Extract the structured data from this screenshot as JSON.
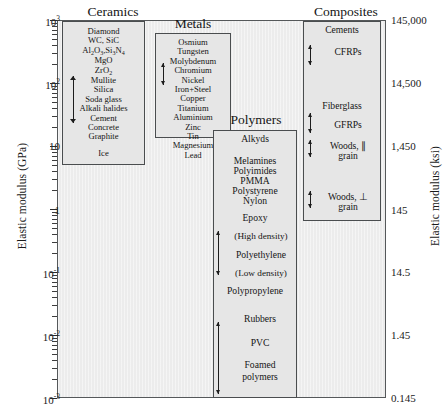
{
  "chart_data": {
    "type": "bar",
    "xlabel": "",
    "ylabel": "Elastic modulus (GPa)",
    "y2label": "Elastic modulus (ksi)",
    "yscale": "log",
    "ylim": [
      0.001,
      1000
    ],
    "y2lim": [
      0.145,
      145000
    ],
    "ytick_labels": [
      "10",
      "10",
      "10",
      "1",
      "10",
      "10",
      "10"
    ],
    "ytick_exponents": [
      "3",
      "2",
      "",
      "",
      "-1",
      "-2",
      "-3"
    ],
    "ytick_values": [
      1000,
      100,
      10,
      1,
      0.1,
      0.01,
      0.001
    ],
    "y2tick_labels": [
      "145,000",
      "14,500",
      "1,450",
      "145",
      "14.5",
      "1.45",
      "0.145"
    ],
    "y2tick_values": [
      145000,
      14500,
      1450,
      145,
      14.5,
      1.45,
      0.145
    ],
    "grid": false,
    "legend": "none",
    "categories": [
      "Ceramics",
      "Metals",
      "Polymers",
      "Composites"
    ],
    "series": [
      {
        "name": "Ceramics",
        "range_gpa": [
          30,
          1000
        ],
        "box_top_gpa": 1000,
        "box_bottom_gpa": 9
      },
      {
        "name": "Metals",
        "range_gpa": [
          40,
          220
        ],
        "box_top_gpa": 700,
        "box_bottom_gpa": 45
      },
      {
        "name": "Polymers",
        "range_gpa": [
          0.005,
          5
        ],
        "box_top_gpa": 5,
        "box_bottom_gpa": 0.0012
      },
      {
        "name": "Composites",
        "range_gpa": [
          0.6,
          300
        ],
        "box_top_gpa": 600,
        "box_bottom_gpa": 0.9
      }
    ]
  },
  "axes": {
    "left": {
      "title": "Elastic modulus (GPa)",
      "ticks": [
        {
          "base": "10",
          "exp": "3"
        },
        {
          "base": "10",
          "exp": "2"
        },
        {
          "base": "10",
          "exp": ""
        },
        {
          "base": "1",
          "exp": ""
        },
        {
          "base": "10",
          "exp": "-1"
        },
        {
          "base": "10",
          "exp": "-2"
        },
        {
          "base": "10",
          "exp": "-3"
        }
      ]
    },
    "right": {
      "title": "Elastic modulus (ksi)",
      "ticks": [
        "145,000",
        "14,500",
        "1,450",
        "145",
        "14.5",
        "1.45",
        "0.145"
      ]
    }
  },
  "classes": {
    "ceramics": {
      "header": "Ceramics",
      "items": [
        "Diamond",
        "WC, SiC",
        "Al2O3,Si3N4",
        "MgO",
        "ZrO2",
        "Mullite",
        "Silica",
        "Soda glass",
        "Alkali halides",
        "Cement",
        "Concrete",
        "Graphite",
        "Ice"
      ]
    },
    "metals": {
      "header": "Metals",
      "items": [
        "Osmium",
        "Tungsten",
        "Molybdenum",
        "Chromium",
        "Nickel",
        "Iron+Steel",
        "Copper",
        "Titanium",
        "Aluminium",
        "Zinc",
        "Tin",
        "Magnesium",
        "Lead"
      ]
    },
    "polymers": {
      "header": "Polymers",
      "items": [
        "Alkyds",
        "Melamines",
        "Polyimides",
        "PMMA",
        "Polystyrene",
        "Nylon",
        "Epoxy",
        "(High density)",
        "Polyethylene",
        "(Low density)",
        "Polypropylene",
        "Rubbers",
        "PVC",
        "Foamed",
        "polymers"
      ]
    },
    "composites": {
      "header": "Composites",
      "items": [
        "Cements",
        "CFRPs",
        "Fiberglass",
        "GFRPs",
        "Woods, ∥",
        "grain",
        "Woods, ⊥",
        "grain"
      ]
    }
  },
  "colors": {
    "plot_background": "#ececec",
    "box_fill": "#e6e6e6",
    "box_border": "#4a4d4f",
    "text": "#151515",
    "arrow": "#1d1d1d"
  }
}
